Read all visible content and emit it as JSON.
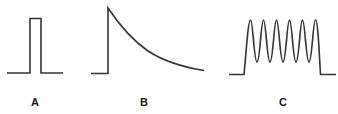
{
  "figure": {
    "panels": [
      {
        "id": "A",
        "label": "A",
        "description": "single rectangular pulse"
      },
      {
        "id": "B",
        "label": "B",
        "description": "step rise followed by exponential decay"
      },
      {
        "id": "C",
        "label": "C",
        "description": "burst of sinusoidal oscillations (7 cycles) within a pulse envelope"
      }
    ],
    "colors": {
      "stroke": "#333333",
      "background": "#ffffff"
    }
  }
}
